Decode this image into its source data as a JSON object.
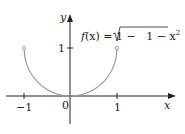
{
  "chart_data": {
    "type": "line",
    "title": "",
    "function_label": "f(x) = 1 − √(1 − x²)",
    "xlabel": "x",
    "ylabel": "y",
    "x_ticks": [
      "-1",
      "0",
      "1"
    ],
    "y_ticks": [
      "1"
    ],
    "xlim": [
      -1.5,
      2.0
    ],
    "ylim": [
      -0.6,
      1.5
    ],
    "grid": false,
    "legend": "none",
    "series": [
      {
        "name": "f(x) = 1 − √(1 − x²)",
        "color": "#999999",
        "x": [
          -1,
          -0.9,
          -0.8,
          -0.6,
          -0.4,
          -0.2,
          0,
          0.2,
          0.4,
          0.6,
          0.8,
          0.9,
          1
        ],
        "y": [
          1,
          0.564,
          0.4,
          0.2,
          0.083,
          0.02,
          0,
          0.02,
          0.083,
          0.2,
          0.4,
          0.564,
          1
        ]
      }
    ],
    "endpoints": [
      [
        -1,
        1
      ],
      [
        1,
        1
      ]
    ]
  },
  "labels": {
    "x_axis": "x",
    "y_axis": "y",
    "origin": "0",
    "x_tick_neg1": "−1",
    "x_tick_1": "1",
    "y_tick_1": "1",
    "func_f": "f",
    "func_paren": "(x) = 1 − ",
    "func_radicand": "1 − x",
    "func_exp": "2"
  }
}
